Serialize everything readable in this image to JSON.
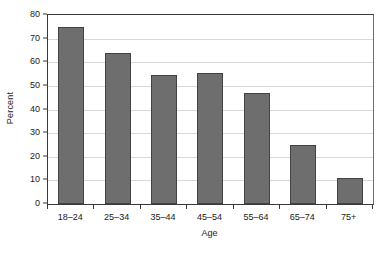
{
  "chart_data": {
    "type": "bar",
    "title": "",
    "subtitle": "",
    "xlabel": "Age",
    "ylabel": "Percent",
    "categories": [
      "18–24",
      "25–34",
      "35–44",
      "45–54",
      "55–64",
      "65–74",
      "75+"
    ],
    "values": [
      75,
      64,
      54.5,
      55.5,
      47,
      25,
      11
    ],
    "series": [
      {
        "name": "Percent",
        "values": [
          75,
          64,
          54.5,
          55.5,
          47,
          25,
          11
        ]
      }
    ],
    "ylim": [
      0,
      80
    ],
    "xlim": null,
    "ytick_values": [
      0,
      10,
      20,
      30,
      40,
      50,
      60,
      70,
      80
    ],
    "ytick_labels": [
      "0",
      "10",
      "20",
      "30",
      "40",
      "50",
      "60",
      "70",
      "80"
    ],
    "ytick_step": 10,
    "grid": "horizontal",
    "legend": "none",
    "annotations": [],
    "colors": {
      "bar_fill": "#6e6e6e",
      "bar_stroke": "#434343",
      "gridline": "#d8d8d8",
      "axis": "#3a3a3a",
      "plot_background": "#ffffff",
      "figure_background": "#ffffff",
      "text": "#1a1a1a"
    }
  }
}
